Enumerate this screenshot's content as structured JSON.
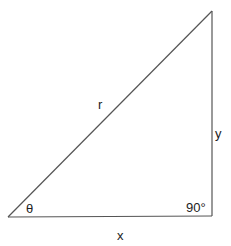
{
  "diagram": {
    "title": "",
    "labels": {
      "hypotenuse": "r",
      "opposite": "y",
      "adjacent": "x",
      "angle": "θ",
      "right_angle": "90°"
    },
    "line_color": "#555555",
    "text_color": "#222222"
  }
}
